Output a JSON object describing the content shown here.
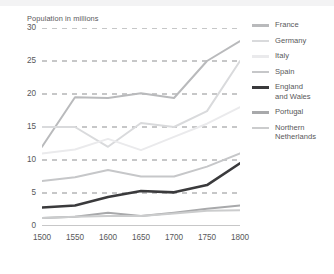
{
  "chart_data": {
    "type": "line",
    "title": "Population in millions",
    "ylabel": "Population in millions",
    "xlabel": "",
    "x": [
      1500,
      1550,
      1600,
      1650,
      1700,
      1750,
      1800
    ],
    "xticks": [
      "1500",
      "1550",
      "1600",
      "1650",
      "1700",
      "1750",
      "1800"
    ],
    "yticks": [
      "0",
      "5",
      "10",
      "15",
      "20",
      "25",
      "30"
    ],
    "ylim": [
      0,
      30
    ],
    "xlim": [
      1500,
      1800
    ],
    "grid": "horizontal-dashed",
    "legend_position": "right",
    "series": [
      {
        "name": "France",
        "color": "#b9babc",
        "width": 2.0,
        "values": [
          12.0,
          19.5,
          19.4,
          20.1,
          19.4,
          25.0,
          28.0
        ]
      },
      {
        "name": "Germany",
        "color": "#d9dadc",
        "width": 2.0,
        "values": [
          15.0,
          15.0,
          12.0,
          15.6,
          15.0,
          17.4,
          25.0
        ]
      },
      {
        "name": "Italy",
        "color": "#eaeaec",
        "width": 2.0,
        "values": [
          11.0,
          11.6,
          13.2,
          11.5,
          13.5,
          15.5,
          18.0
        ]
      },
      {
        "name": "Spain",
        "color": "#c6c7c9",
        "width": 2.0,
        "values": [
          6.8,
          7.4,
          8.5,
          7.5,
          7.5,
          9.0,
          11.0
        ]
      },
      {
        "name": "England\nand Wales",
        "color": "#3a3a3c",
        "width": 2.6,
        "values": [
          2.8,
          3.1,
          4.4,
          5.3,
          5.1,
          6.2,
          9.5
        ]
      },
      {
        "name": "Portugal",
        "color": "#a8a9ab",
        "width": 2.0,
        "values": [
          1.2,
          1.4,
          2.0,
          1.5,
          2.0,
          2.6,
          3.1
        ]
      },
      {
        "name": "Northern\nNetherlands",
        "color": "#cbcccd",
        "width": 2.0,
        "values": [
          1.2,
          1.4,
          1.5,
          1.5,
          1.9,
          2.3,
          2.4
        ]
      }
    ]
  },
  "legend": {
    "items": [
      {
        "label": "France",
        "color": "#b9babc"
      },
      {
        "label": "Germany",
        "color": "#d9dadc"
      },
      {
        "label": "Italy",
        "color": "#eaeaec"
      },
      {
        "label": "Spain",
        "color": "#c6c7c9"
      },
      {
        "label": "England\nand Wales",
        "color": "#3a3a3c"
      },
      {
        "label": "Portugal",
        "color": "#a8a9ab"
      },
      {
        "label": "Northern\nNetherlands",
        "color": "#cbcccd"
      }
    ]
  },
  "colors": {
    "text": "#58585a",
    "grid": "#8e8f91",
    "axis": "#8e8f91",
    "background": "#ffffff",
    "top_band": "#f3f3f4"
  }
}
